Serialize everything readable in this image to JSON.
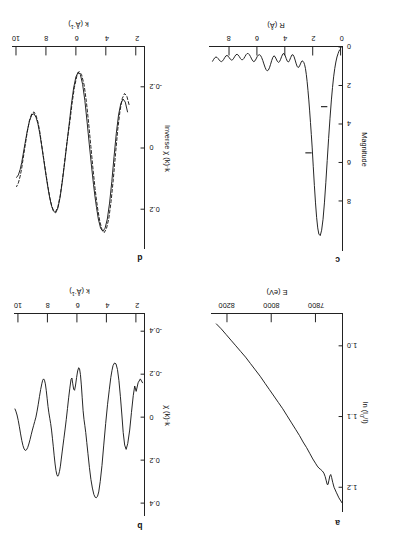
{
  "figure": {
    "orientation_note": "rotated-180",
    "panels": [
      "a",
      "b",
      "c",
      "d"
    ]
  },
  "chart_data": [
    {
      "id": "a",
      "type": "line",
      "panel_label": "a",
      "title": "",
      "xlabel": "E (eV)",
      "ylabel": "ln (I₀/I)",
      "xlim": [
        7680,
        8270
      ],
      "ylim": [
        0.955,
        1.235
      ],
      "xticks": [
        7800,
        8000,
        8200
      ],
      "xticklabels": [
        "7800",
        "8000",
        "8200"
      ],
      "yticks": [
        1.0,
        1.1,
        1.2
      ],
      "yticklabels": [
        "1.0",
        "1.1",
        "1.2"
      ],
      "grid": false,
      "legend": "none",
      "series": [
        {
          "name": "absorption",
          "style": "solid",
          "x": [
            7680,
            7694,
            7706,
            7716,
            7722,
            7727,
            7731,
            7735,
            7739,
            7743,
            7747,
            7751,
            7756,
            7762,
            7769,
            7776,
            7784,
            7792,
            7800,
            7812,
            7826,
            7840,
            7856,
            7872,
            7890,
            7908,
            7928,
            7948,
            7968,
            7988,
            8008,
            8028,
            8050,
            8072,
            8094,
            8116,
            8138,
            8160,
            8182,
            8204,
            8226,
            8248
          ],
          "y": [
            1.222,
            1.215,
            1.207,
            1.2,
            1.193,
            1.186,
            1.182,
            1.184,
            1.19,
            1.196,
            1.196,
            1.191,
            1.185,
            1.18,
            1.177,
            1.175,
            1.173,
            1.17,
            1.166,
            1.16,
            1.152,
            1.144,
            1.136,
            1.127,
            1.118,
            1.109,
            1.099,
            1.089,
            1.08,
            1.071,
            1.062,
            1.053,
            1.043,
            1.034,
            1.025,
            1.016,
            1.008,
            1.0,
            0.992,
            0.984,
            0.976,
            0.969
          ]
        }
      ]
    },
    {
      "id": "b",
      "type": "line",
      "panel_label": "b",
      "title": "",
      "xlabel": "k (Å⁻¹)",
      "ylabel": "χ (k)·k",
      "xlim": [
        1.45,
        10.3
      ],
      "ylim": [
        -0.48,
        0.46
      ],
      "xticks": [
        2,
        4,
        6,
        8,
        10
      ],
      "xticklabels": [
        "2",
        "4",
        "6",
        "8",
        "10"
      ],
      "yticks": [
        -0.4,
        -0.2,
        0,
        0.2,
        0.4
      ],
      "yticklabels": [
        "-0.4",
        "-0.2",
        "0",
        "0.2",
        "0.4"
      ],
      "grid": false,
      "legend": "none",
      "series": [
        {
          "name": "raw chi(k)*k",
          "style": "solid",
          "x": [
            1.55,
            1.7,
            1.85,
            1.98,
            2.08,
            2.18,
            2.3,
            2.42,
            2.55,
            2.66,
            2.76,
            2.86,
            2.95,
            3.05,
            3.15,
            3.25,
            3.35,
            3.45,
            3.55,
            3.62,
            3.7,
            3.8,
            3.92,
            4.05,
            4.18,
            4.3,
            4.42,
            4.52,
            4.6,
            4.68,
            4.76,
            4.85,
            4.95,
            5.05,
            5.15,
            5.25,
            5.33,
            5.4,
            5.46,
            5.52,
            5.58,
            5.64,
            5.7,
            5.76,
            5.82,
            5.88,
            5.95,
            6.02,
            6.1,
            6.16,
            6.22,
            6.28,
            6.34,
            6.4,
            6.48,
            6.56,
            6.64,
            6.72,
            6.8,
            6.88,
            6.94,
            7.0,
            7.06,
            7.12,
            7.18,
            7.24,
            7.3,
            7.36,
            7.42,
            7.48,
            7.54,
            7.6,
            7.66,
            7.72,
            7.78,
            7.84,
            7.9,
            7.96,
            8.02,
            8.08,
            8.14,
            8.2,
            8.26,
            8.32,
            8.38,
            8.46,
            8.54,
            8.62,
            8.7,
            8.78,
            8.86,
            8.94,
            9.02,
            9.1,
            9.18,
            9.26,
            9.34,
            9.42,
            9.5,
            9.58,
            9.66,
            9.74,
            9.82,
            9.9,
            9.98,
            10.06,
            10.14,
            10.2
          ],
          "y": [
            -0.16,
            -0.178,
            -0.16,
            -0.12,
            -0.145,
            -0.1,
            -0.022,
            0.06,
            0.122,
            0.15,
            0.13,
            0.072,
            -0.01,
            -0.095,
            -0.17,
            -0.222,
            -0.248,
            -0.252,
            -0.24,
            -0.218,
            -0.185,
            -0.13,
            -0.06,
            0.03,
            0.13,
            0.225,
            0.3,
            0.348,
            0.368,
            0.375,
            0.373,
            0.36,
            0.33,
            0.29,
            0.235,
            0.17,
            0.118,
            0.072,
            0.04,
            0.01,
            -0.03,
            -0.09,
            -0.15,
            -0.198,
            -0.225,
            -0.23,
            -0.215,
            -0.185,
            -0.145,
            -0.125,
            -0.13,
            -0.155,
            -0.182,
            -0.175,
            -0.135,
            -0.09,
            -0.04,
            0.01,
            0.055,
            0.098,
            0.13,
            0.162,
            0.195,
            0.228,
            0.252,
            0.268,
            0.275,
            0.268,
            0.248,
            0.218,
            0.18,
            0.138,
            0.098,
            0.06,
            0.03,
            0.005,
            -0.02,
            -0.05,
            -0.088,
            -0.125,
            -0.155,
            -0.172,
            -0.178,
            -0.172,
            -0.155,
            -0.128,
            -0.095,
            -0.06,
            -0.028,
            0.0,
            0.02,
            0.04,
            0.06,
            0.082,
            0.105,
            0.125,
            0.142,
            0.152,
            0.155,
            0.148,
            0.132,
            0.108,
            0.078,
            0.045,
            0.015,
            -0.01,
            -0.028,
            -0.038
          ]
        }
      ]
    },
    {
      "id": "c",
      "type": "line",
      "panel_label": "c",
      "title": "",
      "xlabel": "R (Å)",
      "ylabel": "Magnitude",
      "xlim": [
        -0.1,
        9.4
      ],
      "ylim": [
        0,
        10.6
      ],
      "xticks": [
        0,
        2,
        4,
        6,
        8
      ],
      "xticklabels": [
        "0",
        "2",
        "4",
        "6",
        "8"
      ],
      "yticks": [
        0,
        2,
        4,
        6,
        8
      ],
      "yticklabels": [
        "0",
        "2",
        "4",
        "6",
        "8"
      ],
      "grid": false,
      "legend": "none",
      "window_markers": [
        {
          "label": "window-lower",
          "r": 1.18,
          "y": 3.1
        },
        {
          "label": "window-upper",
          "r": 2.3,
          "y": 5.5
        }
      ],
      "series": [
        {
          "name": "Fourier transform magnitude",
          "style": "solid",
          "x": [
            0.0,
            0.06,
            0.12,
            0.18,
            0.26,
            0.34,
            0.42,
            0.5,
            0.58,
            0.66,
            0.76,
            0.86,
            0.96,
            1.06,
            1.16,
            1.26,
            1.36,
            1.46,
            1.56,
            1.64,
            1.72,
            1.8,
            1.88,
            1.96,
            2.04,
            2.1,
            2.16,
            2.22,
            2.28,
            2.34,
            2.4,
            2.46,
            2.52,
            2.58,
            2.64,
            2.7,
            2.76,
            2.82,
            2.88,
            2.94,
            3.0,
            3.06,
            3.12,
            3.18,
            3.26,
            3.34,
            3.42,
            3.5,
            3.58,
            3.66,
            3.74,
            3.82,
            3.9,
            3.98,
            4.06,
            4.14,
            4.22,
            4.3,
            4.38,
            4.46,
            4.54,
            4.62,
            4.7,
            4.78,
            4.86,
            4.94,
            5.02,
            5.1,
            5.18,
            5.26,
            5.34,
            5.42,
            5.5,
            5.58,
            5.66,
            5.74,
            5.82,
            5.9,
            5.98,
            6.06,
            6.14,
            6.22,
            6.3,
            6.38,
            6.46,
            6.54,
            6.62,
            6.7,
            6.78,
            6.86,
            6.94,
            7.02,
            7.1,
            7.18,
            7.26,
            7.34,
            7.42,
            7.5,
            7.58,
            7.66,
            7.74,
            7.82,
            7.9,
            7.98,
            8.06,
            8.14,
            8.22,
            8.3,
            8.38,
            8.46,
            8.54,
            8.62,
            8.7,
            8.78,
            8.86,
            8.94,
            9.02,
            9.1,
            9.18,
            9.26,
            9.34
          ],
          "y": [
            0.1,
            0.14,
            0.22,
            0.34,
            0.52,
            0.78,
            1.12,
            1.55,
            2.1,
            2.75,
            3.7,
            4.75,
            5.9,
            7.05,
            8.1,
            8.95,
            9.52,
            9.8,
            9.72,
            9.4,
            8.85,
            8.1,
            7.2,
            6.22,
            5.2,
            4.55,
            3.92,
            3.32,
            2.75,
            2.25,
            1.8,
            1.42,
            1.12,
            0.92,
            0.8,
            0.74,
            0.72,
            0.78,
            0.88,
            0.98,
            1.05,
            1.06,
            1.0,
            0.88,
            0.68,
            0.5,
            0.4,
            0.42,
            0.55,
            0.7,
            0.78,
            0.74,
            0.6,
            0.44,
            0.34,
            0.36,
            0.48,
            0.64,
            0.76,
            0.8,
            0.74,
            0.62,
            0.5,
            0.46,
            0.54,
            0.7,
            0.9,
            1.08,
            1.2,
            1.24,
            1.18,
            1.05,
            0.88,
            0.7,
            0.55,
            0.44,
            0.4,
            0.42,
            0.5,
            0.62,
            0.72,
            0.76,
            0.72,
            0.62,
            0.5,
            0.4,
            0.34,
            0.34,
            0.4,
            0.5,
            0.6,
            0.66,
            0.66,
            0.6,
            0.5,
            0.42,
            0.38,
            0.4,
            0.48,
            0.58,
            0.66,
            0.68,
            0.64,
            0.56,
            0.48,
            0.44,
            0.46,
            0.54,
            0.64,
            0.72,
            0.76,
            0.74,
            0.68,
            0.6,
            0.54,
            0.52,
            0.56,
            0.64,
            0.74
          ]
        }
      ]
    },
    {
      "id": "d",
      "type": "line",
      "panel_label": "d",
      "title": "",
      "xlabel": "k (Å⁻¹)",
      "ylabel": "Inverse χ (k)·k",
      "xlim": [
        1.45,
        10.3
      ],
      "ylim": [
        -0.33,
        0.33
      ],
      "xticks": [
        2,
        4,
        6,
        8,
        10
      ],
      "xticklabels": [
        "2",
        "4",
        "6",
        "8",
        "10"
      ],
      "yticks": [
        -0.2,
        0,
        0.2
      ],
      "yticklabels": [
        "-0.2",
        "0",
        "0.2"
      ],
      "grid": false,
      "legend": "none",
      "series": [
        {
          "name": "filtered data",
          "style": "solid",
          "x": [
            2.55,
            2.7,
            2.85,
            3.0,
            3.15,
            3.3,
            3.45,
            3.6,
            3.75,
            3.9,
            4.05,
            4.2,
            4.35,
            4.5,
            4.62,
            4.72,
            4.82,
            4.95,
            5.1,
            5.25,
            5.4,
            5.55,
            5.7,
            5.85,
            6.0,
            6.15,
            6.3,
            6.42,
            6.52,
            6.62,
            6.75,
            6.9,
            7.05,
            7.2,
            7.35,
            7.5,
            7.62,
            7.74,
            7.86,
            8.0,
            8.15,
            8.3,
            8.42,
            8.54,
            8.66,
            8.8,
            8.95,
            9.1,
            9.25,
            9.4,
            9.52,
            9.62,
            9.72,
            9.84,
            9.96
          ],
          "y": [
            -0.118,
            -0.15,
            -0.16,
            -0.145,
            -0.108,
            -0.048,
            0.028,
            0.11,
            0.18,
            0.232,
            0.262,
            0.272,
            0.262,
            0.232,
            0.195,
            0.16,
            0.12,
            0.062,
            -0.01,
            -0.085,
            -0.155,
            -0.208,
            -0.24,
            -0.248,
            -0.232,
            -0.196,
            -0.142,
            -0.09,
            -0.048,
            -0.006,
            0.048,
            0.108,
            0.16,
            0.196,
            0.212,
            0.206,
            0.19,
            0.165,
            0.132,
            0.088,
            0.038,
            -0.012,
            -0.05,
            -0.08,
            -0.1,
            -0.112,
            -0.108,
            -0.088,
            -0.055,
            -0.014,
            0.02,
            0.048,
            0.07,
            0.088,
            0.096
          ]
        },
        {
          "name": "theoretical fit",
          "style": "dashed",
          "x": [
            2.45,
            2.6,
            2.75,
            2.9,
            3.05,
            3.2,
            3.35,
            3.5,
            3.65,
            3.8,
            3.95,
            4.1,
            4.25,
            4.4,
            4.52,
            4.62,
            4.72,
            4.85,
            5.0,
            5.15,
            5.3,
            5.45,
            5.62,
            5.78,
            5.94,
            6.1,
            6.26,
            6.38,
            6.5,
            6.62,
            6.75,
            6.9,
            7.05,
            7.2,
            7.35,
            7.5,
            7.62,
            7.74,
            7.86,
            8.0,
            8.15,
            8.3,
            8.42,
            8.54,
            8.66,
            8.8,
            8.95,
            9.1,
            9.25,
            9.4,
            9.52,
            9.62,
            9.72,
            9.84,
            9.96
          ],
          "y": [
            -0.142,
            -0.17,
            -0.178,
            -0.162,
            -0.122,
            -0.062,
            0.018,
            0.102,
            0.175,
            0.23,
            0.262,
            0.276,
            0.268,
            0.24,
            0.206,
            0.172,
            0.132,
            0.072,
            -0.005,
            -0.082,
            -0.152,
            -0.206,
            -0.24,
            -0.25,
            -0.234,
            -0.198,
            -0.144,
            -0.094,
            -0.052,
            -0.01,
            0.044,
            0.104,
            0.156,
            0.192,
            0.208,
            0.204,
            0.188,
            0.162,
            0.128,
            0.084,
            0.034,
            -0.016,
            -0.056,
            -0.086,
            -0.106,
            -0.118,
            -0.112,
            -0.09,
            -0.052,
            -0.004,
            0.034,
            0.066,
            0.092,
            0.114,
            0.126
          ]
        }
      ]
    }
  ]
}
